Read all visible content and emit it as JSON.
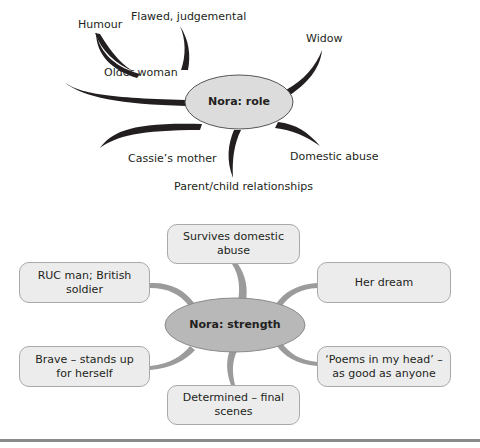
{
  "role_map": {
    "center": "Nora: role",
    "branches": [
      {
        "label": "Humour"
      },
      {
        "label": "Flawed, judgemental"
      },
      {
        "label": "Widow"
      },
      {
        "label": "Older woman"
      },
      {
        "label": "Domestic abuse"
      },
      {
        "label": "Cassie’s mother"
      },
      {
        "label": "Parent/child relationships"
      }
    ]
  },
  "strength_map": {
    "center": "Nora: strength",
    "boxes": [
      {
        "label": "Survives domestic abuse"
      },
      {
        "label": "RUC man; British soldier"
      },
      {
        "label": "Her dream"
      },
      {
        "label": "Brave – stands up for herself"
      },
      {
        "label": "‘Poems in my head’ – as good as anyone"
      },
      {
        "label": "Determined – final scenes"
      }
    ]
  },
  "colors": {
    "role_center_fill": "#dcdcdc",
    "strength_center_fill": "#b8b8b8",
    "box_fill": "#ececec",
    "role_branch": "#231f20",
    "strength_branch": "#9b9b9b"
  }
}
